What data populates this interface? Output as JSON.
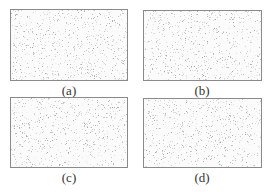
{
  "figure": {
    "panels": [
      {
        "id": "a",
        "label": "(a)",
        "x": 10,
        "y": 9,
        "w": 118,
        "h": 72,
        "seed": 11
      },
      {
        "id": "b",
        "label": "(b)",
        "x": 143,
        "y": 10,
        "w": 119,
        "h": 71,
        "seed": 23
      },
      {
        "id": "c",
        "label": "(c)",
        "x": 10,
        "y": 97,
        "w": 118,
        "h": 71,
        "seed": 37
      },
      {
        "id": "d",
        "label": "(d)",
        "x": 143,
        "y": 98,
        "w": 119,
        "h": 70,
        "seed": 53
      }
    ],
    "captions": [
      {
        "text": "(a)",
        "cx": 69,
        "y": 84
      },
      {
        "text": "(b)",
        "cx": 202,
        "y": 84
      },
      {
        "text": "(c)",
        "cx": 69,
        "y": 171
      },
      {
        "text": "(d)",
        "cx": 202,
        "y": 171
      }
    ],
    "colors": {
      "border": "#8a8a8a",
      "noise": "#9a9a9a",
      "background": "#ffffff",
      "caption": "#333333"
    }
  }
}
